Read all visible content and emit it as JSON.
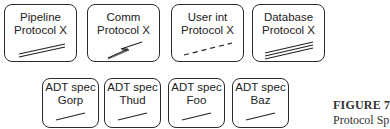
{
  "protocols": [
    {
      "line1": "Pipeline",
      "line2": "Protocol X",
      "glyph": "double-line"
    },
    {
      "line1": "Comm",
      "line2": "Protocol X",
      "glyph": "lightning-bolt"
    },
    {
      "line1": "User int",
      "line2": "Protocol X",
      "glyph": "dashed-line"
    },
    {
      "line1": "Database",
      "line2": "Protocol X",
      "glyph": "triple-line"
    }
  ],
  "adt_specs": [
    {
      "line1": "ADT spec",
      "line2": "Gorp",
      "glyph": "single-line"
    },
    {
      "line1": "ADT spec",
      "line2": "Thud",
      "glyph": "single-line"
    },
    {
      "line1": "ADT spec",
      "line2": "Foo",
      "glyph": "single-line"
    },
    {
      "line1": "ADT spec",
      "line2": "Baz",
      "glyph": "single-line"
    }
  ],
  "caption": {
    "title": "FIGURE 7",
    "subtitle": "Protocol Sp"
  }
}
